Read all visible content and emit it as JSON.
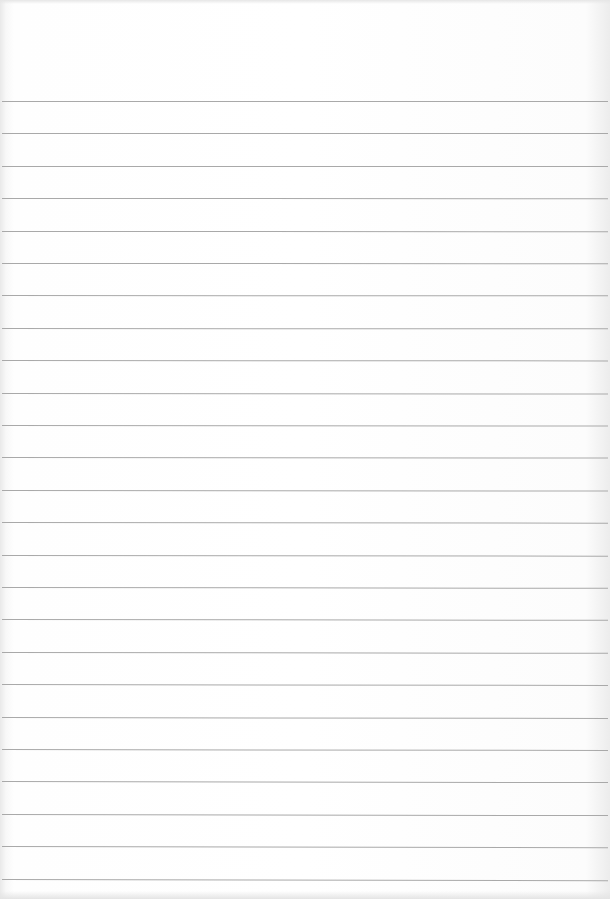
{
  "page": {
    "type": "ruled-paper",
    "line_count": 25,
    "first_line_y": 101,
    "line_spacing": 32.4,
    "line_color": "#a9a9a9",
    "paper_color": "#fdfdfd"
  }
}
